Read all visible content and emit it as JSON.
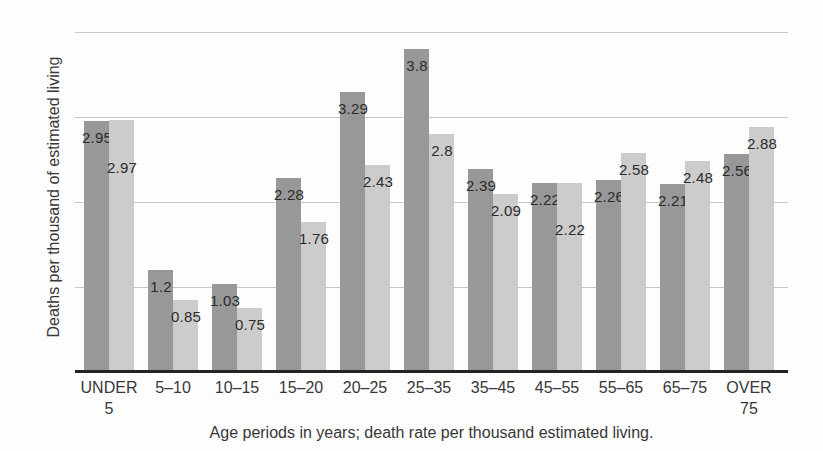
{
  "chart_data": {
    "type": "bar",
    "title": "",
    "xlabel": "Age periods in years; death rate per thousand estimated living.",
    "ylabel": "Deaths per thousand of estimated living",
    "categories": [
      "UNDER\n5",
      "5–10",
      "10–15",
      "15–20",
      "20–25",
      "25–35",
      "35–45",
      "45–55",
      "55–65",
      "65–75",
      "OVER\n75"
    ],
    "series": [
      {
        "name": "dark-gray-series",
        "color": "#989898",
        "values": [
          2.95,
          1.2,
          1.03,
          2.28,
          3.29,
          3.8,
          2.39,
          2.22,
          2.26,
          2.21,
          2.56
        ],
        "labels": [
          "2.95",
          "1.2",
          "1.03",
          "2.28",
          "3.29",
          "3.8",
          "2.39",
          "2.22",
          "2.26",
          "2.21",
          "2.56"
        ]
      },
      {
        "name": "light-gray-series",
        "color": "#cccccc",
        "values": [
          2.97,
          0.85,
          0.75,
          1.76,
          2.43,
          2.8,
          2.09,
          2.22,
          2.58,
          2.48,
          2.88
        ],
        "labels": [
          "2.97",
          "0.85",
          "0.75",
          "1.76",
          "2.43",
          "2.8",
          "2.09",
          "2.22",
          "2.58",
          "2.48",
          "2.88"
        ]
      }
    ],
    "ylim": [
      0,
      4
    ],
    "gridline_values": [
      1,
      2,
      3,
      4
    ],
    "grid": true,
    "legend_position": "none",
    "value_label_color": "#2b2b2b",
    "gridline_color": "#bdbdbd",
    "axis_line_color": "#242424"
  }
}
